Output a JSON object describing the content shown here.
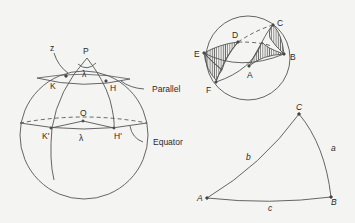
{
  "figure_left": {
    "labels": {
      "z": "z",
      "P": "P",
      "lambda_top": "λ",
      "K": "K",
      "H": "H",
      "O": "O",
      "K_prime": "K'",
      "H_prime": "H'",
      "lambda_bottom": "λ",
      "parallel": "Parallel",
      "equator": "Equator"
    }
  },
  "figure_top_right": {
    "labels": {
      "C": "C",
      "D": "D",
      "E": "E",
      "B": "B",
      "A": "A",
      "F": "F"
    }
  },
  "figure_bottom_right": {
    "vertices": {
      "A": "A",
      "B": "B",
      "C": "C"
    },
    "sides": {
      "a": "a",
      "b": "b",
      "c": "c"
    }
  }
}
